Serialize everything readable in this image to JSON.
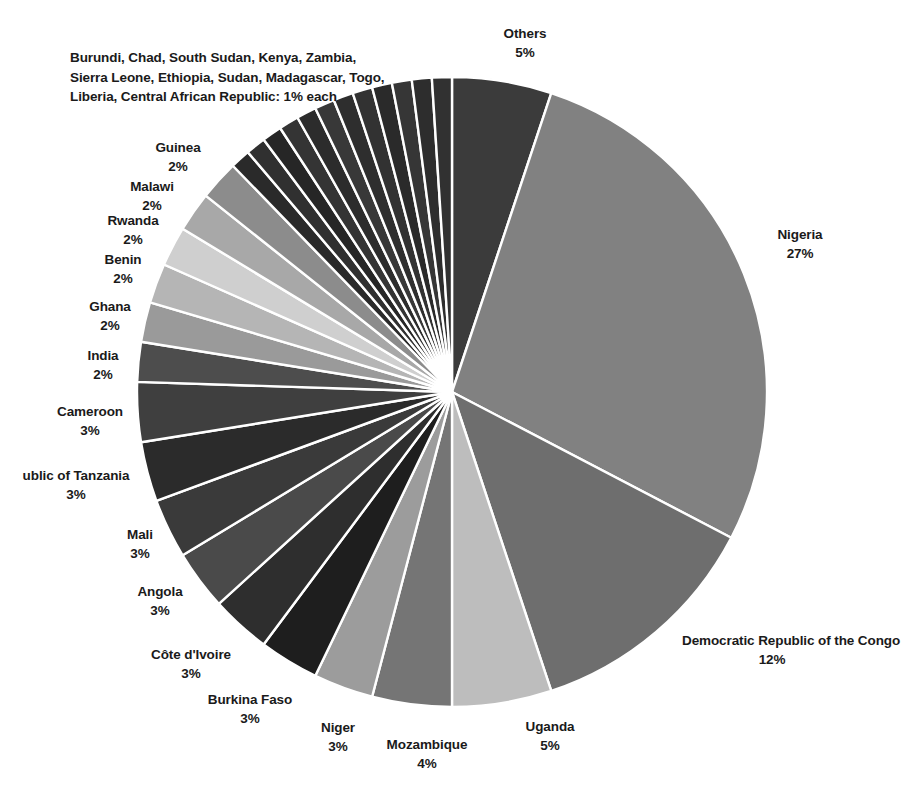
{
  "chart_data": {
    "type": "pie",
    "title": "",
    "subtitle": "",
    "xlabel": "",
    "ylabel": "",
    "legend_position": "labels-outside",
    "grid": false,
    "units": "percent",
    "start_angle_deg": -90,
    "direction": "clockwise",
    "categories": [
      "Others",
      "Nigeria",
      "Democratic Republic of the Congo",
      "Uganda",
      "Mozambique",
      "Niger",
      "Burkina Faso",
      "Côte d'Ivoire",
      "Angola",
      "Mali",
      "ublic of Tanzania",
      "Cameroon",
      "India",
      "Ghana",
      "Benin",
      "Rwanda",
      "Malawi",
      "Guinea",
      "Burundi",
      "Chad",
      "South Sudan",
      "Kenya",
      "Zambia",
      "Sierra Leone",
      "Ethiopia",
      "Sudan",
      "Madagascar",
      "Togo",
      "Liberia",
      "Central African Republic"
    ],
    "values": [
      5,
      27,
      12,
      5,
      4,
      3,
      3,
      3,
      3,
      3,
      3,
      3,
      2,
      2,
      2,
      2,
      2,
      2,
      1,
      1,
      1,
      1,
      1,
      1,
      1,
      1,
      1,
      1,
      1,
      1
    ],
    "colors": [
      "#3b3b3b",
      "#818181",
      "#6e6e6e",
      "#bdbdbd",
      "#757575",
      "#9c9c9c",
      "#1e1e1e",
      "#2e2e2e",
      "#4a4a4a",
      "#3a3a3a",
      "#2b2b2b",
      "#3f3f3f",
      "#4d4d4d",
      "#9a9a9a",
      "#b5b5b5",
      "#cfcfcf",
      "#a8a8a8",
      "#8c8c8c",
      "#2a2a2a",
      "#303030",
      "#262626",
      "#343434",
      "#2c2c2c",
      "#383838",
      "#2e2e2e",
      "#323232",
      "#2a2a2a",
      "#363636",
      "#2d2d2d",
      "#313131"
    ],
    "slice_border_color": "#ffffff",
    "slice_border_width": 2.4,
    "center_x": 452,
    "center_y": 392,
    "radius": 315
  },
  "labels": [
    {
      "name": "Others",
      "pct": "5%",
      "x": 525,
      "y": 24,
      "align": "center"
    },
    {
      "name": "Nigeria",
      "pct": "27%",
      "x": 800,
      "y": 225,
      "align": "center"
    },
    {
      "name": "Democratic Republic of the Congo",
      "pct": "12%",
      "x": 772,
      "y": 631,
      "align": "center"
    },
    {
      "name": "Uganda",
      "pct": "5%",
      "x": 550,
      "y": 717,
      "align": "center"
    },
    {
      "name": "Mozambique",
      "pct": "4%",
      "x": 427,
      "y": 735,
      "align": "center"
    },
    {
      "name": "Niger",
      "pct": "3%",
      "x": 338,
      "y": 718,
      "align": "center"
    },
    {
      "name": "Burkina Faso",
      "pct": "3%",
      "x": 250,
      "y": 690,
      "align": "center"
    },
    {
      "name": "Côte d'Ivoire",
      "pct": "3%",
      "x": 191,
      "y": 645,
      "align": "center"
    },
    {
      "name": "Angola",
      "pct": "3%",
      "x": 160,
      "y": 582,
      "align": "center"
    },
    {
      "name": "Mali",
      "pct": "3%",
      "x": 140,
      "y": 525,
      "align": "center"
    },
    {
      "name": "ublic of Tanzania",
      "pct": "3%",
      "x": 76,
      "y": 466,
      "align": "center"
    },
    {
      "name": "Cameroon",
      "pct": "3%",
      "x": 90,
      "y": 402,
      "align": "center"
    },
    {
      "name": "India",
      "pct": "2%",
      "x": 103,
      "y": 346,
      "align": "center"
    },
    {
      "name": "Ghana",
      "pct": "2%",
      "x": 110,
      "y": 297,
      "align": "center"
    },
    {
      "name": "Benin",
      "pct": "2%",
      "x": 123,
      "y": 250,
      "align": "center"
    },
    {
      "name": "Rwanda",
      "pct": "2%",
      "x": 133,
      "y": 211,
      "align": "center"
    },
    {
      "name": "Malawi",
      "pct": "2%",
      "x": 152,
      "y": 177,
      "align": "center"
    },
    {
      "name": "Guinea",
      "pct": "2%",
      "x": 178,
      "y": 138,
      "align": "center"
    }
  ],
  "group_note": {
    "line1": "Burundi, Chad, South Sudan, Kenya, Zambia,",
    "line2": "Sierra Leone, Ethiopia, Sudan, Madagascar, Togo,",
    "line3": "Liberia, Central African Republic: 1% each",
    "x": 70,
    "y": 48
  }
}
